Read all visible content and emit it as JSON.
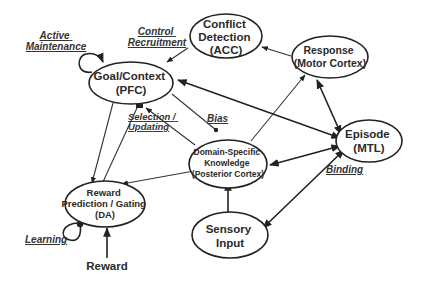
{
  "diagram": {
    "nodes": {
      "conflict": {
        "lines": [
          "Conflict",
          "Detection",
          "(ACC)"
        ]
      },
      "goal": {
        "lines": [
          "Goal/Context",
          "(PFC)"
        ]
      },
      "response": {
        "lines": [
          "Response",
          "(Motor Cortex)"
        ]
      },
      "episode": {
        "lines": [
          "Episode",
          "(MTL)"
        ]
      },
      "domain": {
        "lines": [
          "Domain-Specific",
          "Knowledge",
          "(Posterior Cortex)"
        ]
      },
      "reward_pred": {
        "lines": [
          "Reward",
          "Prediction / Gating",
          "(DA)"
        ]
      },
      "sensory": {
        "lines": [
          "Sensory",
          "Input"
        ]
      },
      "reward": {
        "lines": [
          "Reward"
        ]
      }
    },
    "labels": {
      "active_maintenance": [
        "Active",
        "Maintenance"
      ],
      "control_recruitment": [
        "Control",
        "Recruitment"
      ],
      "selection_updating": [
        "Selection /",
        "Updating"
      ],
      "bias": "Bias",
      "binding": "Binding",
      "learning": "Learning"
    }
  },
  "colors": {
    "stroke": "#222222",
    "text": "#2a2a2a",
    "background": "#ffffff"
  }
}
